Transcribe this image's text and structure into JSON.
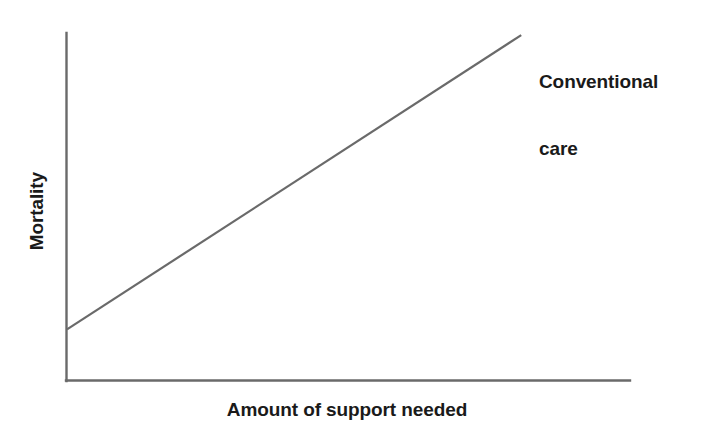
{
  "figure": {
    "background_color": "#ffffff",
    "width": 702,
    "height": 435
  },
  "chart_data": {
    "type": "line",
    "title": "",
    "subtitle": "",
    "xlabel": "Amount of support needed",
    "ylabel": "Mortality",
    "xlim": [
      0,
      100
    ],
    "ylim": [
      0,
      100
    ],
    "grid": false,
    "axis_ticks": "none",
    "tick_labels": {
      "x": [],
      "y": []
    },
    "legend": {
      "position": "inline-annotation-right",
      "entries": [
        "Conventional care"
      ]
    },
    "series": [
      {
        "name": "Conventional care",
        "color": "#6a6a6a",
        "line_width": 2.2,
        "x": [
          0,
          100
        ],
        "values": [
          14.7,
          99.4
        ],
        "description": "Straight ascending line: mortality rises linearly with amount of support needed"
      }
    ],
    "annotations": [
      {
        "name": "conventional-care-label",
        "lines": [
          "Conventional",
          "care"
        ],
        "text": "Conventional care",
        "attached_series": "Conventional care",
        "color": "#1a1a1a"
      }
    ],
    "axes_style": {
      "color": "#6a6a6a",
      "spines": [
        "left",
        "bottom"
      ],
      "line_width": 2.4
    }
  },
  "labels": {
    "x_axis": "Amount of support needed",
    "y_axis": "Mortality",
    "annotation_line_1": "Conventional",
    "annotation_line_2": "care"
  },
  "colors": {
    "line": "#6a6a6a",
    "axis": "#6a6a6a",
    "text": "#1a1a1a",
    "background": "#ffffff"
  }
}
